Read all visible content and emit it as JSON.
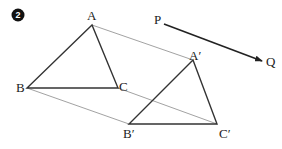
{
  "problem_number": "2",
  "points": {
    "A": {
      "label": "A",
      "x": 92,
      "y": 25
    },
    "B": {
      "label": "B",
      "x": 27,
      "y": 88
    },
    "C": {
      "label": "C",
      "x": 118,
      "y": 88
    },
    "A_prime": {
      "label": "A′",
      "x": 193,
      "y": 60
    },
    "B_prime": {
      "label": "B′",
      "x": 129,
      "y": 124
    },
    "C_prime": {
      "label": "C′",
      "x": 217,
      "y": 124
    },
    "P": {
      "label": "P",
      "x": 164,
      "y": 24
    },
    "Q": {
      "label": "Q",
      "x": 263,
      "y": 61
    }
  },
  "colors": {
    "triangle_stroke": "#333333",
    "connector_stroke": "#888888",
    "vector_stroke": "#222222",
    "badge_fill": "#111111"
  }
}
